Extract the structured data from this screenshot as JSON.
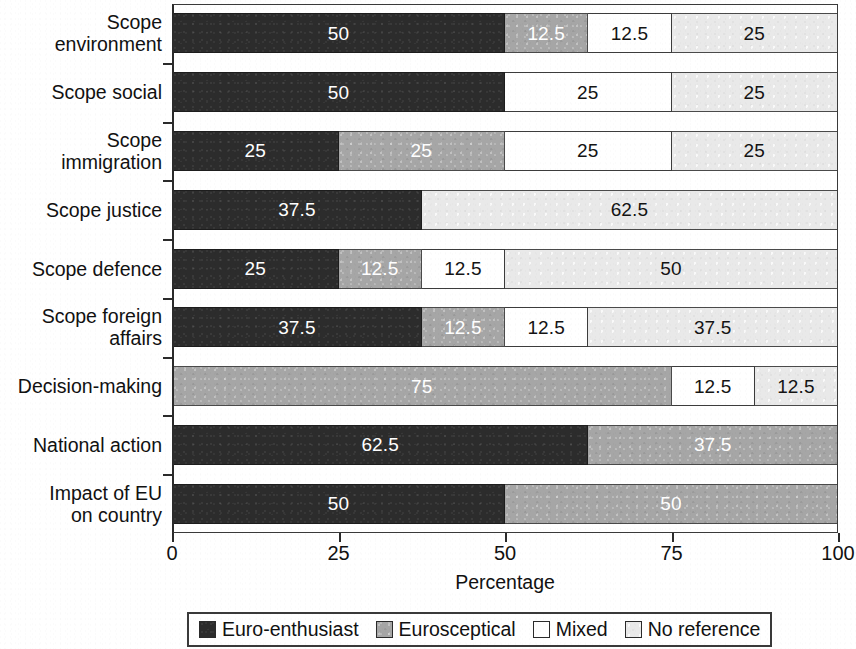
{
  "chart_data": {
    "type": "bar",
    "orientation": "horizontal",
    "stacked": true,
    "stack_mode": "percent",
    "title": "",
    "xlabel": "Percentage",
    "ylabel": "",
    "xlim": [
      0,
      100
    ],
    "xticks": [
      "0",
      "25",
      "50",
      "75",
      "100"
    ],
    "xtick_values": [
      0,
      25,
      50,
      75,
      100
    ],
    "grid": false,
    "legend_position": "bottom",
    "categories": [
      "Scope\nenvironment",
      "Scope social",
      "Scope\nimmigration",
      "Scope justice",
      "Scope defence",
      "Scope foreign\naffairs",
      "Decision-making",
      "National action",
      "Impact of EU\non country"
    ],
    "series": [
      {
        "name": "Euro-enthusiast",
        "color": "#2c2c2c",
        "values": [
          50,
          50,
          25,
          37.5,
          25,
          37.5,
          0,
          62.5,
          50
        ]
      },
      {
        "name": "Eurosceptical",
        "color": "#a6a6a6",
        "values": [
          12.5,
          0,
          25,
          0,
          12.5,
          12.5,
          75,
          37.5,
          50
        ]
      },
      {
        "name": "Mixed",
        "color": "#ffffff",
        "values": [
          12.5,
          25,
          25,
          0,
          12.5,
          12.5,
          12.5,
          0,
          0
        ]
      },
      {
        "name": "No reference",
        "color": "#e9e9e9",
        "values": [
          25,
          25,
          25,
          62.5,
          50,
          37.5,
          12.5,
          0,
          0
        ]
      }
    ],
    "rows": [
      {
        "category": "Scope\nenvironment",
        "segments": [
          {
            "series": "Euro-enthusiast",
            "value": 50,
            "label": "50"
          },
          {
            "series": "Eurosceptical",
            "value": 12.5,
            "label": "12.5"
          },
          {
            "series": "Mixed",
            "value": 12.5,
            "label": "12.5"
          },
          {
            "series": "No reference",
            "value": 25,
            "label": "25"
          }
        ]
      },
      {
        "category": "Scope social",
        "segments": [
          {
            "series": "Euro-enthusiast",
            "value": 50,
            "label": "50"
          },
          {
            "series": "Mixed",
            "value": 25,
            "label": "25"
          },
          {
            "series": "No reference",
            "value": 25,
            "label": "25"
          }
        ]
      },
      {
        "category": "Scope\nimmigration",
        "segments": [
          {
            "series": "Euro-enthusiast",
            "value": 25,
            "label": "25"
          },
          {
            "series": "Eurosceptical",
            "value": 25,
            "label": "25"
          },
          {
            "series": "Mixed",
            "value": 25,
            "label": "25"
          },
          {
            "series": "No reference",
            "value": 25,
            "label": "25"
          }
        ]
      },
      {
        "category": "Scope justice",
        "segments": [
          {
            "series": "Euro-enthusiast",
            "value": 37.5,
            "label": "37.5"
          },
          {
            "series": "No reference",
            "value": 62.5,
            "label": "62.5"
          }
        ]
      },
      {
        "category": "Scope defence",
        "segments": [
          {
            "series": "Euro-enthusiast",
            "value": 25,
            "label": "25"
          },
          {
            "series": "Eurosceptical",
            "value": 12.5,
            "label": "12.5"
          },
          {
            "series": "Mixed",
            "value": 12.5,
            "label": "12.5"
          },
          {
            "series": "No reference",
            "value": 50,
            "label": "50"
          }
        ]
      },
      {
        "category": "Scope foreign\naffairs",
        "segments": [
          {
            "series": "Euro-enthusiast",
            "value": 37.5,
            "label": "37.5"
          },
          {
            "series": "Eurosceptical",
            "value": 12.5,
            "label": "12.5"
          },
          {
            "series": "Mixed",
            "value": 12.5,
            "label": "12.5"
          },
          {
            "series": "No reference",
            "value": 37.5,
            "label": "37.5"
          }
        ]
      },
      {
        "category": "Decision-making",
        "segments": [
          {
            "series": "Eurosceptical",
            "value": 75,
            "label": "75"
          },
          {
            "series": "Mixed",
            "value": 12.5,
            "label": "12.5"
          },
          {
            "series": "No reference",
            "value": 12.5,
            "label": "12.5"
          }
        ]
      },
      {
        "category": "National action",
        "segments": [
          {
            "series": "Euro-enthusiast",
            "value": 62.5,
            "label": "62.5"
          },
          {
            "series": "Eurosceptical",
            "value": 37.5,
            "label": "37.5"
          }
        ]
      },
      {
        "category": "Impact of EU\non country",
        "segments": [
          {
            "series": "Euro-enthusiast",
            "value": 50,
            "label": "50"
          },
          {
            "series": "Eurosceptical",
            "value": 50,
            "label": "50"
          }
        ]
      }
    ],
    "legend": [
      {
        "label": "Euro-enthusiast",
        "color": "#2c2c2c"
      },
      {
        "label": "Eurosceptical",
        "color": "#a6a6a6"
      },
      {
        "label": "Mixed",
        "color": "#ffffff"
      },
      {
        "label": "No reference",
        "color": "#e9e9e9"
      }
    ]
  }
}
